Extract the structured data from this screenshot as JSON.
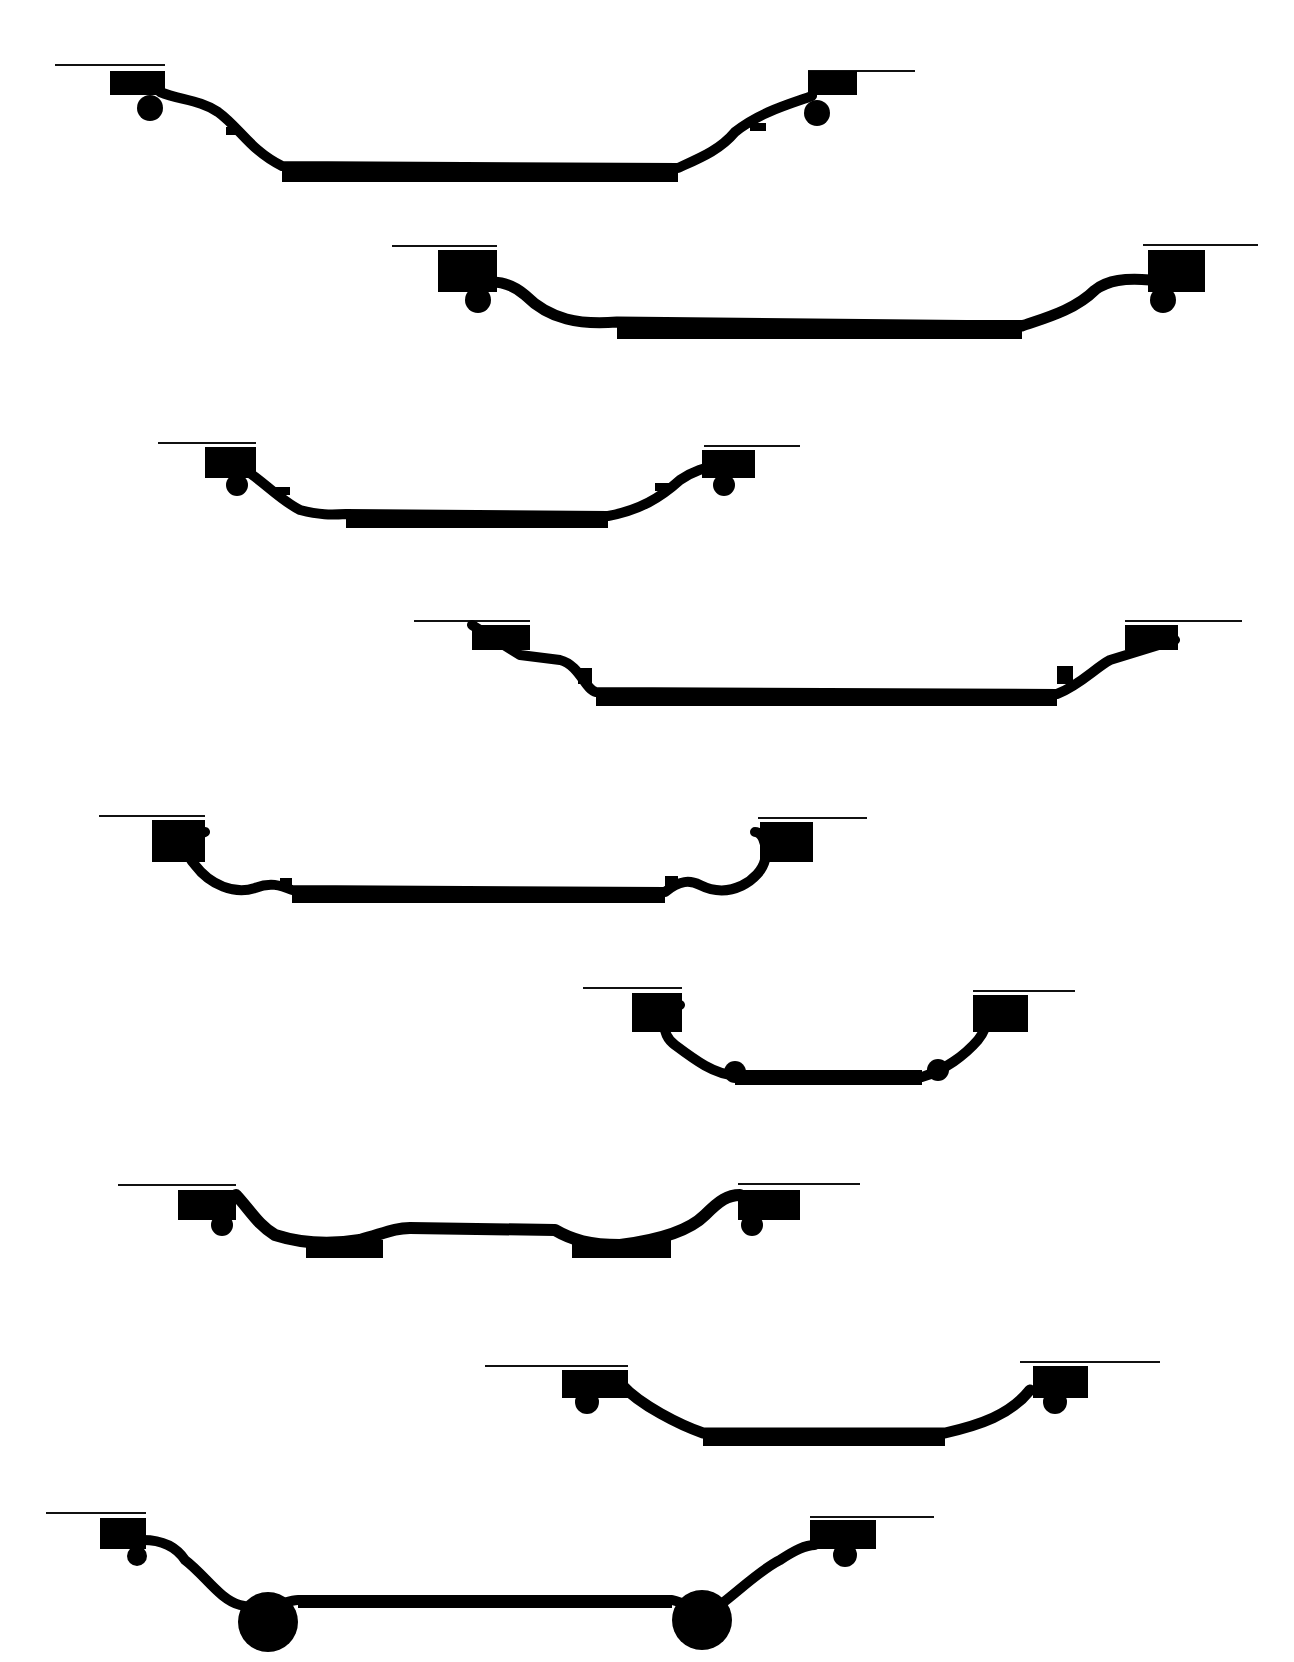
{
  "figure": {
    "type": "technical-drawing",
    "background": "#ffffff",
    "ink": "#000000",
    "profile_count": 9
  },
  "profiles": [
    {
      "id": 1,
      "ref_lines": [
        [
          55,
          65,
          165,
          65
        ],
        [
          808,
          71,
          915,
          71
        ]
      ],
      "flanges": [
        [
          110,
          71,
          165,
          95
        ],
        [
          808,
          71,
          857,
          95
        ]
      ],
      "beads": [
        [
          150,
          108,
          13
        ],
        [
          817,
          113,
          13
        ]
      ],
      "ledges": [
        [
          226,
          127,
          240,
          135
        ],
        [
          750,
          123,
          766,
          131
        ]
      ],
      "wells": [
        [
          282,
          164,
          678,
          182
        ]
      ],
      "path": "M160,92 C180,100 200,100 218,112 C240,128 250,150 282,166 L678,168 C700,158 720,150 735,132 C760,112 790,104 812,96",
      "stroke": 10
    },
    {
      "id": 2,
      "ref_lines": [
        [
          392,
          246,
          497,
          246
        ],
        [
          1143,
          245,
          1258,
          245
        ]
      ],
      "flanges": [
        [
          438,
          250,
          497,
          292
        ],
        [
          1148,
          250,
          1205,
          292
        ]
      ],
      "beads": [
        [
          478,
          300,
          13
        ],
        [
          1163,
          300,
          13
        ]
      ],
      "ledges": [],
      "wells": [
        [
          617,
          320,
          1022,
          339
        ]
      ],
      "path": "M470,282 C495,280 510,282 525,295 C550,320 580,325 617,322 L1022,326 C1045,318 1075,310 1095,290 C1108,280 1125,278 1150,280",
      "stroke": 11
    },
    {
      "id": 3,
      "ref_lines": [
        [
          158,
          443,
          256,
          443
        ],
        [
          704,
          446,
          800,
          446
        ]
      ],
      "flanges": [
        [
          205,
          447,
          256,
          478
        ],
        [
          702,
          450,
          755,
          478
        ]
      ],
      "beads": [
        [
          237,
          485,
          11
        ],
        [
          724,
          485,
          11
        ]
      ],
      "ledges": [
        [
          275,
          487,
          290,
          495
        ],
        [
          655,
          483,
          672,
          491
        ]
      ],
      "wells": [
        [
          346,
          511,
          608,
          528
        ]
      ],
      "path": "M245,470 C262,480 280,500 300,510 C320,515 330,515 346,514 L608,516 C640,510 660,498 680,480 C695,470 705,468 715,466",
      "stroke": 10
    },
    {
      "id": 4,
      "ref_lines": [
        [
          414,
          621,
          530,
          621
        ],
        [
          1125,
          621,
          1242,
          621
        ]
      ],
      "flanges": [
        [
          472,
          625,
          530,
          650
        ],
        [
          1125,
          625,
          1178,
          650
        ]
      ],
      "beads": [],
      "ledges": [
        [
          578,
          668,
          592,
          684
        ],
        [
          1057,
          666,
          1073,
          684
        ]
      ],
      "wells": [
        [
          596,
          690,
          1057,
          706
        ]
      ],
      "path": "M472,625 L520,655 L560,660 C580,665 585,690 596,692 L1057,694 C1080,685 1095,668 1110,660 L1175,640",
      "stroke": 10
    },
    {
      "id": 5,
      "ref_lines": [
        [
          99,
          816,
          205,
          816
        ],
        [
          758,
          818,
          867,
          818
        ]
      ],
      "flanges": [
        [
          152,
          820,
          205,
          862
        ],
        [
          760,
          822,
          813,
          862
        ]
      ],
      "beads": [],
      "ledges": [
        [
          280,
          878,
          292,
          888
        ],
        [
          665,
          876,
          678,
          886
        ]
      ],
      "wells": [
        [
          292,
          888,
          665,
          903
        ]
      ],
      "path": "M205,832 C185,838 185,855 195,865 C210,885 235,895 255,888 C270,882 280,885 292,890 L665,892 C680,880 690,880 700,885 C730,900 760,880 765,860 C768,840 760,832 755,832",
      "stroke": 10
    },
    {
      "id": 6,
      "ref_lines": [
        [
          583,
          988,
          682,
          988
        ],
        [
          973,
          991,
          1075,
          991
        ]
      ],
      "flanges": [
        [
          632,
          993,
          682,
          1032
        ],
        [
          973,
          995,
          1028,
          1032
        ]
      ],
      "beads": [
        [
          735,
          1072,
          11
        ],
        [
          938,
          1070,
          11
        ]
      ],
      "ledges": [],
      "wells": [
        [
          735,
          1070,
          922,
          1085
        ]
      ],
      "path": "M680,1005 C660,1010 660,1035 675,1045 C695,1060 715,1075 735,1075 L922,1077 C945,1070 965,1055 978,1040 C990,1025 988,1010 980,1005",
      "stroke": 10
    },
    {
      "id": 7,
      "ref_lines": [
        [
          118,
          1185,
          236,
          1185
        ],
        [
          738,
          1184,
          860,
          1184
        ]
      ],
      "flanges": [
        [
          178,
          1190,
          236,
          1220
        ],
        [
          738,
          1190,
          800,
          1220
        ]
      ],
      "beads": [
        [
          222,
          1225,
          11
        ],
        [
          752,
          1225,
          11
        ]
      ],
      "ledges": [],
      "wells": [
        [
          306,
          1240,
          383,
          1258
        ],
        [
          572,
          1240,
          671,
          1258
        ]
      ],
      "path": "M236,1195 C250,1210 258,1225 275,1235 C300,1243 330,1245 360,1240 C385,1233 395,1228 410,1228 L555,1230 C572,1240 590,1245 620,1245 C660,1240 690,1230 705,1215 C720,1200 728,1195 740,1195",
      "stroke": 12
    },
    {
      "id": 8,
      "ref_lines": [
        [
          485,
          1366,
          628,
          1366
        ],
        [
          1020,
          1362,
          1160,
          1362
        ]
      ],
      "flanges": [
        [
          562,
          1370,
          628,
          1398
        ],
        [
          1033,
          1366,
          1088,
          1398
        ]
      ],
      "beads": [
        [
          587,
          1402,
          12
        ],
        [
          1055,
          1402,
          12
        ]
      ],
      "ledges": [],
      "wells": [
        [
          703,
          1430,
          945,
          1446
        ]
      ],
      "path": "M622,1385 C640,1405 680,1425 703,1433 L945,1433 C980,1425 1010,1415 1030,1390",
      "stroke": 11
    },
    {
      "id": 9,
      "ref_lines": [
        [
          46,
          1513,
          146,
          1513
        ],
        [
          810,
          1517,
          934,
          1517
        ]
      ],
      "flanges": [
        [
          100,
          1518,
          146,
          1549
        ],
        [
          810,
          1520,
          876,
          1549
        ]
      ],
      "beads": [
        [
          137,
          1556,
          10
        ],
        [
          845,
          1555,
          12
        ],
        [
          268,
          1622,
          30
        ],
        [
          702,
          1620,
          30
        ]
      ],
      "ledges": [],
      "wells": [
        [
          298,
          1595,
          672,
          1608
        ]
      ],
      "path": "M143,1540 C160,1540 175,1545 185,1560 C205,1575 220,1600 240,1605 C270,1612 285,1600 298,1600 L672,1600 C690,1605 705,1612 720,1605 C740,1590 760,1570 780,1560 C795,1550 805,1545 815,1545",
      "stroke": 10
    }
  ]
}
